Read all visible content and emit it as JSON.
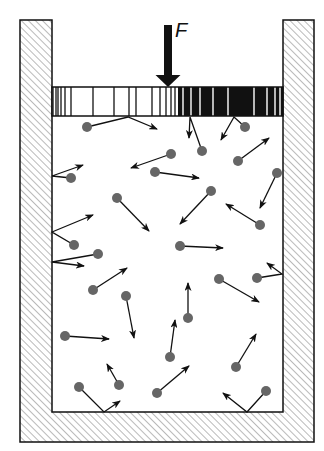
{
  "figure": {
    "force_label": "F",
    "colors": {
      "line": "#111111",
      "molecule": "#666666",
      "hatch": "#555555",
      "background": "#ffffff"
    }
  },
  "container": {
    "outer": {
      "x": 20,
      "y": 20,
      "w": 294,
      "h": 422
    },
    "inner": {
      "x": 52,
      "y": 20,
      "w": 231,
      "h": 392
    }
  },
  "piston": {
    "x": 52,
    "y": 87,
    "w": 231,
    "h": 29,
    "dark_from_x": 178,
    "dark_stripes_x": [
      53,
      56,
      58,
      61,
      65,
      71,
      93,
      114,
      129,
      136,
      152,
      160,
      166,
      171,
      175
    ],
    "light_stripes_x": [
      183,
      191,
      200,
      213,
      228,
      254,
      267,
      275,
      280
    ]
  },
  "force_arrow": {
    "x": 168,
    "y_top": 25,
    "y_tip": 87,
    "shaft_w": 8,
    "head_w": 25,
    "head_h": 12
  },
  "molecules": [
    {
      "cx": 87,
      "cy": 127,
      "path": [
        [
          87,
          127
        ],
        [
          128,
          117
        ],
        [
          157,
          129
        ]
      ]
    },
    {
      "cx": 202,
      "cy": 151,
      "path": [
        [
          202,
          151
        ],
        [
          190,
          117
        ],
        [
          189,
          138
        ]
      ]
    },
    {
      "cx": 245,
      "cy": 127,
      "path": [
        [
          245,
          127
        ],
        [
          234,
          117
        ],
        [
          221,
          140
        ]
      ]
    },
    {
      "cx": 238,
      "cy": 161,
      "path": [
        [
          238,
          161
        ],
        [
          269,
          138
        ]
      ]
    },
    {
      "cx": 171,
      "cy": 154,
      "path": [
        [
          171,
          154
        ],
        [
          131,
          168
        ]
      ]
    },
    {
      "cx": 155,
      "cy": 172,
      "path": [
        [
          155,
          172
        ],
        [
          199,
          178
        ]
      ]
    },
    {
      "cx": 71,
      "cy": 178,
      "path": [
        [
          71,
          178
        ],
        [
          52,
          176
        ],
        [
          83,
          165
        ]
      ]
    },
    {
      "cx": 277,
      "cy": 173,
      "path": [
        [
          277,
          173
        ],
        [
          260,
          208
        ]
      ]
    },
    {
      "cx": 117,
      "cy": 198,
      "path": [
        [
          117,
          198
        ],
        [
          149,
          231
        ]
      ]
    },
    {
      "cx": 211,
      "cy": 191,
      "path": [
        [
          211,
          191
        ],
        [
          180,
          224
        ]
      ]
    },
    {
      "cx": 260,
      "cy": 225,
      "path": [
        [
          260,
          225
        ],
        [
          226,
          204
        ]
      ]
    },
    {
      "cx": 74,
      "cy": 245,
      "path": [
        [
          74,
          245
        ],
        [
          52,
          232
        ],
        [
          93,
          215
        ]
      ]
    },
    {
      "cx": 180,
      "cy": 246,
      "path": [
        [
          180,
          246
        ],
        [
          223,
          248
        ]
      ]
    },
    {
      "cx": 98,
      "cy": 254,
      "path": [
        [
          98,
          254
        ],
        [
          52,
          262
        ],
        [
          84,
          266
        ]
      ]
    },
    {
      "cx": 93,
      "cy": 290,
      "path": [
        [
          93,
          290
        ],
        [
          127,
          268
        ]
      ]
    },
    {
      "cx": 126,
      "cy": 296,
      "path": [
        [
          126,
          296
        ],
        [
          134,
          338
        ]
      ]
    },
    {
      "cx": 188,
      "cy": 318,
      "path": [
        [
          188,
          318
        ],
        [
          188,
          283
        ]
      ]
    },
    {
      "cx": 219,
      "cy": 279,
      "path": [
        [
          219,
          279
        ],
        [
          259,
          302
        ]
      ]
    },
    {
      "cx": 257,
      "cy": 278,
      "path": [
        [
          257,
          278
        ],
        [
          282,
          274
        ],
        [
          267,
          263
        ]
      ]
    },
    {
      "cx": 65,
      "cy": 336,
      "path": [
        [
          65,
          336
        ],
        [
          109,
          339
        ]
      ]
    },
    {
      "cx": 170,
      "cy": 357,
      "path": [
        [
          170,
          357
        ],
        [
          175,
          320
        ]
      ]
    },
    {
      "cx": 236,
      "cy": 367,
      "path": [
        [
          236,
          367
        ],
        [
          256,
          334
        ]
      ]
    },
    {
      "cx": 157,
      "cy": 393,
      "path": [
        [
          157,
          393
        ],
        [
          189,
          366
        ]
      ]
    },
    {
      "cx": 119,
      "cy": 385,
      "path": [
        [
          119,
          385
        ],
        [
          107,
          364
        ]
      ]
    },
    {
      "cx": 79,
      "cy": 387,
      "path": [
        [
          79,
          387
        ],
        [
          104,
          412
        ],
        [
          120,
          401
        ]
      ]
    },
    {
      "cx": 266,
      "cy": 391,
      "path": [
        [
          266,
          391
        ],
        [
          247,
          412
        ],
        [
          223,
          393
        ]
      ]
    }
  ]
}
